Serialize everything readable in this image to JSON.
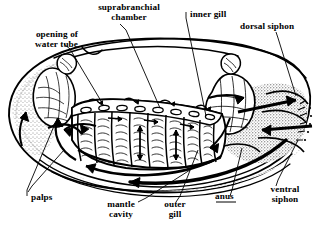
{
  "figure": {
    "ink": "#000000",
    "paper": "#ffffff"
  },
  "labels": {
    "opening_of_water_tube": "opening of\nwater tube",
    "suprabranchial_chamber": "suprabranchial\nchamber",
    "inner_gill": "inner gill",
    "dorsal_siphon": "dorsal siphon",
    "palps": "palps",
    "mantle_cavity": "mantle\ncavity",
    "outer_gill": "outer\ngill",
    "anus": "anus",
    "ventral_siphon": "ventral\nsiphon"
  }
}
